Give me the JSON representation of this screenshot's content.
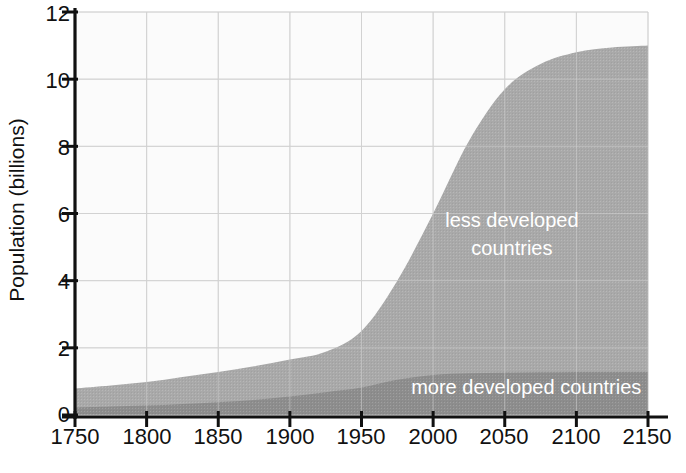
{
  "chart_data": {
    "type": "area",
    "stacked": true,
    "title": "",
    "xlabel": "",
    "ylabel": "Population (billions)",
    "xlim": [
      1750,
      2150
    ],
    "ylim": [
      0,
      12
    ],
    "xticks": [
      1750,
      1800,
      1850,
      1900,
      1950,
      2000,
      2050,
      2100,
      2150
    ],
    "yticks": [
      0,
      2,
      4,
      6,
      8,
      10,
      12
    ],
    "grid": true,
    "legend_position": "inline-annotations",
    "x": [
      1750,
      1775,
      1800,
      1825,
      1850,
      1875,
      1900,
      1925,
      1950,
      1975,
      2000,
      2025,
      2050,
      2075,
      2100,
      2125,
      2150
    ],
    "series": [
      {
        "name": "more developed countries",
        "color": "#8d8d8d",
        "label": "more developed countries",
        "values": [
          0.22,
          0.25,
          0.28,
          0.33,
          0.38,
          0.45,
          0.55,
          0.68,
          0.82,
          1.05,
          1.19,
          1.24,
          1.26,
          1.27,
          1.28,
          1.28,
          1.28
        ]
      },
      {
        "name": "less developed countries",
        "color": "#a9a9a9",
        "label": "less developed countries",
        "values": [
          0.57,
          0.63,
          0.7,
          0.8,
          0.9,
          1.0,
          1.1,
          1.2,
          1.68,
          2.95,
          4.81,
          6.92,
          8.44,
          9.18,
          9.52,
          9.66,
          9.72
        ]
      }
    ],
    "totals": [
      0.79,
      0.88,
      0.98,
      1.13,
      1.28,
      1.45,
      1.65,
      1.88,
      2.5,
      4.0,
      6.0,
      8.16,
      9.7,
      10.45,
      10.8,
      10.94,
      11.0
    ],
    "annotations": [
      {
        "text_line1": "less developed",
        "text_line2": "countries",
        "x": 2055,
        "y": 5.6,
        "color": "#ffffff"
      },
      {
        "text_line1": "more developed countries",
        "text_line2": "",
        "x": 2065,
        "y": 0.62,
        "color": "#ffffff"
      }
    ],
    "axis_color": "#111111",
    "grid_color": "#d2d2d2",
    "plot_background": "#fbfbfb"
  },
  "axes": {
    "ylabel": "Population (billions)",
    "ytick_labels": [
      "0",
      "2",
      "4",
      "6",
      "8",
      "10",
      "12"
    ],
    "xtick_labels": [
      "1750",
      "1800",
      "1850",
      "1900",
      "1950",
      "2000",
      "2050",
      "2100",
      "2150"
    ]
  },
  "labels": {
    "less_developed_line1": "less developed",
    "less_developed_line2": "countries",
    "more_developed": "more developed countries"
  }
}
